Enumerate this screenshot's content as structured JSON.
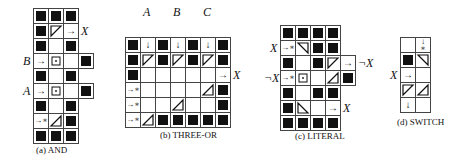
{
  "figure": {
    "panels": [
      {
        "id": "a",
        "caption": "(a) AND",
        "origin": [
          33,
          8
        ],
        "cell": 15,
        "labels": [
          {
            "text": "X",
            "row": 1,
            "col": 3,
            "side": "right"
          },
          {
            "text": "B",
            "row": 3,
            "col": 0,
            "side": "left"
          },
          {
            "text": "A",
            "row": 5,
            "col": 0,
            "side": "left"
          }
        ],
        "rows": [
          [
            "B",
            "B",
            "B"
          ],
          [
            "B",
            "tri-ul",
            "arrow-r"
          ],
          [
            "B",
            "",
            "B"
          ],
          [
            "arrow-r",
            "target",
            "",
            "B"
          ],
          [
            "B",
            "",
            "B"
          ],
          [
            "arrow-r",
            "target",
            "",
            "B"
          ],
          [
            "B",
            "",
            "B"
          ],
          [
            "arrow-r-star",
            "tri-lr",
            "B"
          ],
          [
            "B",
            "B",
            "B"
          ]
        ]
      },
      {
        "id": "b",
        "caption": "(b) THREE-OR",
        "origin": [
          125,
          37
        ],
        "cell": 15,
        "labels": [
          {
            "text": "A",
            "row": -1,
            "col": 1,
            "side": "top"
          },
          {
            "text": "B",
            "row": -1,
            "col": 3,
            "side": "top"
          },
          {
            "text": "C",
            "row": -1,
            "col": 5,
            "side": "top"
          },
          {
            "text": "X",
            "row": 2,
            "col": 7,
            "side": "right"
          }
        ],
        "rows": [
          [
            "B",
            "arrow-d",
            "B",
            "arrow-d",
            "B",
            "arrow-d",
            "B"
          ],
          [
            "B",
            "tri-ul",
            "B",
            "tri-ul",
            "B",
            "tri-ul",
            "B"
          ],
          [
            "B",
            "",
            "",
            "",
            "",
            "",
            "arrow-r"
          ],
          [
            "arrow-r-star",
            "",
            "",
            "",
            "",
            "tri-lr",
            "B"
          ],
          [
            "arrow-r-star",
            "",
            "",
            "tri-lr",
            "",
            "",
            "B"
          ],
          [
            "arrow-r-star",
            "tri-lr",
            "B",
            "B",
            "B",
            "B",
            "B"
          ]
        ]
      },
      {
        "id": "c",
        "caption": "(c) LITERAL",
        "origin": [
          280,
          25
        ],
        "cell": 15,
        "labels": [
          {
            "text": "X",
            "row": 1,
            "col": 0,
            "side": "left"
          },
          {
            "text": "¬X",
            "row": 2,
            "col": 5,
            "side": "right"
          },
          {
            "text": "¬X",
            "row": 3,
            "col": 0,
            "side": "left"
          },
          {
            "text": "X",
            "row": 5,
            "col": 4,
            "side": "right"
          }
        ],
        "rows": [
          [
            "B",
            "B",
            "B",
            "B"
          ],
          [
            "arrow-r-star",
            "tri-ur",
            "B",
            "B"
          ],
          [
            "B",
            "",
            "B",
            "tri-ul",
            "arrow-r"
          ],
          [
            "arrow-r-star",
            "target",
            "",
            "tri-lr",
            "B"
          ],
          [
            "B",
            "",
            "B",
            "B"
          ],
          [
            "B",
            "tri-ll",
            "",
            "arrow-r"
          ],
          [
            "B",
            "B",
            "B",
            "B"
          ]
        ]
      },
      {
        "id": "d",
        "caption": "(d) SWITCH",
        "origin": [
          400,
          37
        ],
        "cell": 15,
        "labels": [
          {
            "text": "X",
            "row": 2,
            "col": 0,
            "side": "left"
          }
        ],
        "rows": [
          [
            "",
            "arrow-d-star"
          ],
          [
            "B",
            "tri-ur"
          ],
          [
            "arrow-r",
            ""
          ],
          [
            "tri-ul",
            "tri-lr"
          ],
          [
            "arrow-d",
            ""
          ]
        ]
      }
    ],
    "captions": {
      "a": "(a) AND",
      "b": "(b) THREE-OR",
      "c": "(c) LITERAL",
      "d": "(d) SWITCH"
    },
    "colors": {
      "block": "#111111",
      "grid_line": "#444444",
      "background": "#ffffff"
    },
    "legend_glyphs": {
      "B": "filled-block",
      "arrow-r": "→",
      "arrow-d": "↓",
      "arrow-r-star": "→∗",
      "arrow-d-star": "↓∗",
      "target": "⊡",
      "tri-ul": "◸",
      "tri-ur": "◹",
      "tri-ll": "◺",
      "tri-lr": "◿"
    }
  }
}
